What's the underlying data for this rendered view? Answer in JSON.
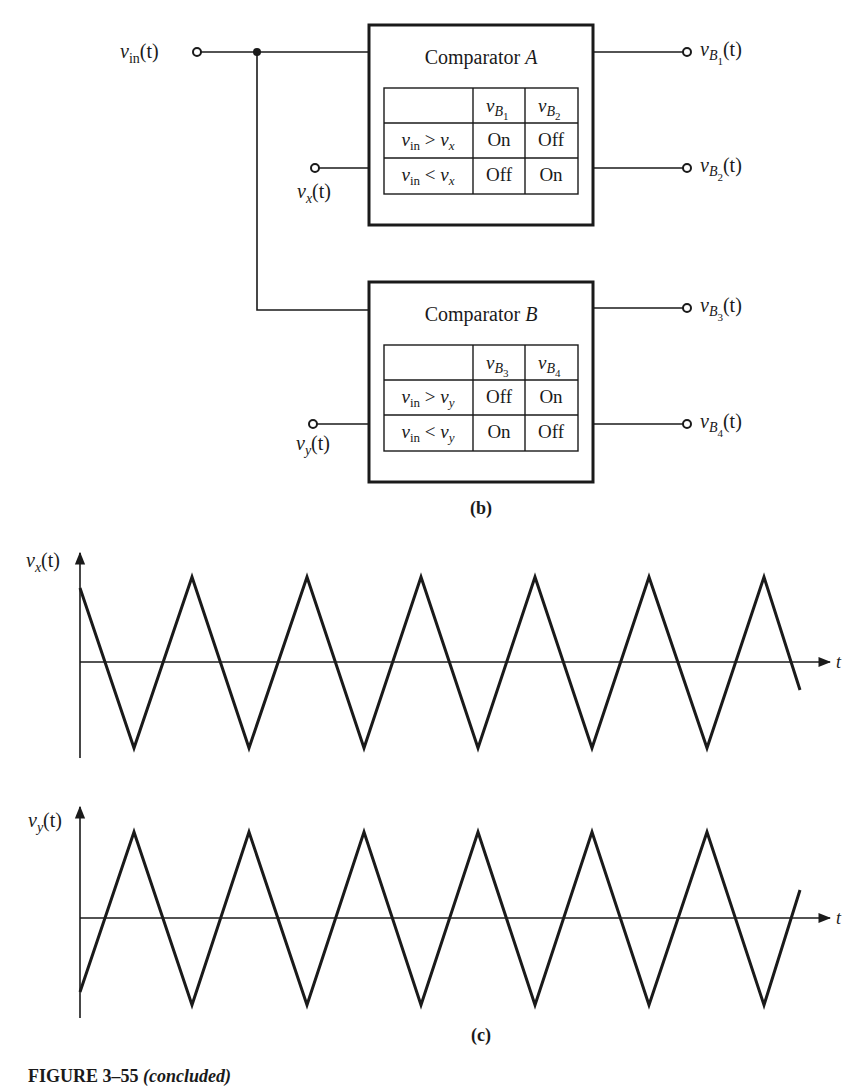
{
  "diagram": {
    "part_label": "(b)",
    "inputs": {
      "vin": {
        "var": "v",
        "sub": "in",
        "suffix": "(t)"
      },
      "vx": {
        "var": "v",
        "sub": "x",
        "suffix": "(t)"
      },
      "vy": {
        "var": "v",
        "sub": "y",
        "suffix": "(t)"
      }
    },
    "comparators": [
      {
        "title_prefix": "Comparator ",
        "title_letter": "A",
        "columns": [
          {
            "var": "v",
            "sub": "B",
            "subsub": "1"
          },
          {
            "var": "v",
            "sub": "B",
            "subsub": "2"
          }
        ],
        "rows": [
          {
            "cond_lhs_sub": "in",
            "op": ">",
            "cond_rhs_sub": "x",
            "values": [
              "On",
              "Off"
            ]
          },
          {
            "cond_lhs_sub": "in",
            "op": "<",
            "cond_rhs_sub": "x",
            "values": [
              "Off",
              "On"
            ]
          }
        ],
        "outputs": [
          {
            "var": "v",
            "sub": "B",
            "subsub": "1",
            "suffix": "(t)"
          },
          {
            "var": "v",
            "sub": "B",
            "subsub": "2",
            "suffix": "(t)"
          }
        ]
      },
      {
        "title_prefix": "Comparator ",
        "title_letter": "B",
        "columns": [
          {
            "var": "v",
            "sub": "B",
            "subsub": "3"
          },
          {
            "var": "v",
            "sub": "B",
            "subsub": "4"
          }
        ],
        "rows": [
          {
            "cond_lhs_sub": "in",
            "op": ">",
            "cond_rhs_sub": "y",
            "values": [
              "Off",
              "On"
            ]
          },
          {
            "cond_lhs_sub": "in",
            "op": "<",
            "cond_rhs_sub": "y",
            "values": [
              "On",
              "Off"
            ]
          }
        ],
        "outputs": [
          {
            "var": "v",
            "sub": "B",
            "subsub": "3",
            "suffix": "(t)"
          },
          {
            "var": "v",
            "sub": "B",
            "subsub": "4",
            "suffix": "(t)"
          }
        ]
      }
    ]
  },
  "waveforms": {
    "part_label": "(c)",
    "plots": [
      {
        "ylabel_var": "v",
        "ylabel_sub": "x",
        "ylabel_suffix": "(t)",
        "xlabel": "t",
        "shape": "triangle",
        "start": "positive, falling",
        "peaks_count": 6,
        "troughs_count": 6
      },
      {
        "ylabel_var": "v",
        "ylabel_sub": "y",
        "ylabel_suffix": "(t)",
        "xlabel": "t",
        "shape": "triangle",
        "start": "negative, rising",
        "peaks_count": 6,
        "troughs_count": 6
      }
    ]
  },
  "caption": {
    "bold": "FIGURE 3–55 ",
    "italic": "(concluded)"
  }
}
